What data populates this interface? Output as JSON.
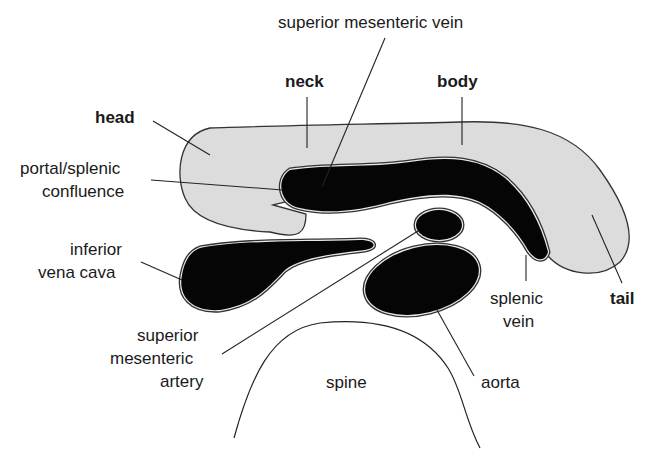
{
  "diagram": {
    "colors": {
      "pancreas_fill": "#dcdcdc",
      "vessel_fill": "#050505",
      "outline": "#333333",
      "text": "#1a1a1a",
      "background": "#ffffff"
    },
    "labels": {
      "head": "head",
      "neck": "neck",
      "body": "body",
      "tail": "tail",
      "smv": "superior mesenteric vein",
      "confluence_line1": "portal/splenic",
      "confluence_line2": "confluence",
      "ivc_line1": "inferior",
      "ivc_line2": "vena cava",
      "sma_line1": "superior",
      "sma_line2": "mesenteric",
      "sma_line3": "artery",
      "splenic_vein_line1": "splenic",
      "splenic_vein_line2": "vein",
      "aorta": "aorta",
      "spine": "spine"
    },
    "structures": [
      {
        "id": "pancreas",
        "type": "organ",
        "parts": [
          "head",
          "neck",
          "body",
          "tail"
        ]
      },
      {
        "id": "portal-splenic-confluence",
        "type": "vessel"
      },
      {
        "id": "splenic-vein",
        "type": "vessel"
      },
      {
        "id": "inferior-vena-cava",
        "type": "vessel"
      },
      {
        "id": "superior-mesenteric-artery",
        "type": "vessel"
      },
      {
        "id": "aorta",
        "type": "vessel"
      },
      {
        "id": "spine",
        "type": "bone-outline"
      }
    ]
  }
}
